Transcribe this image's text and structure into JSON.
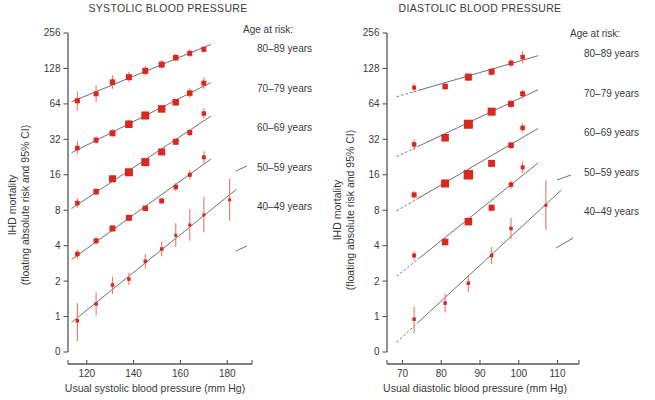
{
  "figure": {
    "accent_color": "#d8281f",
    "ci_color": "#e8786a",
    "line_color": "#4a4a4a",
    "text_color": "#3a3a3a"
  },
  "legend": {
    "heading": "Age at risk:",
    "items": [
      {
        "label": "80–89 years"
      },
      {
        "label": "70–79 years"
      },
      {
        "label": "60–69 years"
      },
      {
        "label": "50–59 years"
      },
      {
        "label": "40–49 years"
      }
    ]
  },
  "chart_data": [
    {
      "id": "systolic",
      "type": "scatter",
      "title": "SYSTOLIC BLOOD PRESSURE",
      "xlabel": "Usual systolic blood pressure (mm Hg)",
      "ylabel": "IHD mortality\n(floating absolute risk and 95% CI)",
      "ylabel_line1": "IHD mortality",
      "ylabel_line2": "(floating absolute risk and 95% CI)",
      "yscale": "log2",
      "yticks": [
        0,
        1,
        2,
        4,
        8,
        16,
        32,
        64,
        128,
        256
      ],
      "yticklabels": [
        "0",
        "1",
        "2",
        "4",
        "8",
        "16",
        "32",
        "64",
        "128",
        "256"
      ],
      "xticks": [
        120,
        140,
        160,
        180
      ],
      "xticklabels": [
        "120",
        "140",
        "160",
        "180"
      ],
      "xlim": [
        112,
        188
      ],
      "grid": false,
      "legend_position": "right",
      "series": [
        {
          "name": "80–89 years",
          "x": [
            116,
            124,
            131,
            138,
            145,
            152,
            158,
            164,
            170
          ],
          "values": [
            68,
            78,
            98,
            108,
            122,
            138,
            158,
            172,
            186
          ],
          "ci_low": [
            56,
            66,
            86,
            98,
            112,
            128,
            148,
            160,
            176
          ],
          "ci_high": [
            82,
            92,
            112,
            120,
            134,
            150,
            170,
            186,
            198
          ],
          "sizes": [
            5,
            5,
            5.5,
            6,
            6,
            6,
            5.5,
            5,
            5
          ]
        },
        {
          "name": "70–79 years",
          "x": [
            116,
            124,
            131,
            138,
            145,
            152,
            158,
            164,
            170
          ],
          "values": [
            27,
            31.5,
            36,
            43,
            51,
            58,
            66,
            79,
            96
          ],
          "ci_low": [
            24,
            29,
            34,
            40,
            48,
            55,
            62,
            72,
            86
          ],
          "ci_high": [
            31,
            34,
            39,
            47,
            55,
            62,
            71,
            87,
            108
          ],
          "sizes": [
            4.5,
            5,
            6,
            7.5,
            8,
            7.5,
            6.5,
            5.5,
            5
          ]
        },
        {
          "name": "60–69 years",
          "x": [
            116,
            124,
            131,
            138,
            145,
            152,
            158,
            164,
            170
          ],
          "values": [
            9.2,
            11.5,
            14.8,
            16.8,
            20.5,
            25,
            30.5,
            36.5,
            53
          ],
          "ci_low": [
            8.4,
            10.8,
            14.0,
            15.8,
            19.4,
            23.6,
            28.8,
            34.0,
            48
          ],
          "ci_high": [
            10.1,
            12.3,
            15.7,
            17.9,
            21.7,
            26.5,
            32.3,
            39.2,
            59
          ],
          "sizes": [
            4.5,
            5.5,
            7,
            8,
            8,
            7,
            6,
            5,
            4.5
          ]
        },
        {
          "name": "50–59 years",
          "x": [
            116,
            124,
            131,
            138,
            145,
            152,
            158,
            164,
            170
          ],
          "values": [
            3.4,
            4.4,
            5.6,
            6.9,
            8.3,
            9.6,
            12.6,
            16.0,
            22.5
          ],
          "ci_low": [
            3.1,
            4.1,
            5.3,
            6.5,
            7.9,
            9.1,
            11.6,
            14.6,
            20.0
          ],
          "ci_high": [
            3.7,
            4.7,
            5.9,
            7.3,
            8.7,
            10.1,
            13.7,
            17.5,
            25.3
          ],
          "sizes": [
            4.5,
            5,
            6,
            6,
            5.5,
            5,
            4.5,
            4,
            4
          ]
        },
        {
          "name": "40–49 years",
          "x": [
            116,
            124,
            131,
            138,
            145,
            152,
            158,
            164,
            170,
            181
          ],
          "values": [
            0.92,
            1.28,
            1.85,
            2.08,
            2.95,
            3.75,
            4.9,
            6.0,
            7.3,
            9.8
          ],
          "ci_low": [
            0.62,
            1.02,
            1.55,
            1.85,
            2.55,
            3.25,
            3.9,
            4.4,
            5.2,
            6.5
          ],
          "ci_high": [
            1.3,
            1.6,
            2.18,
            2.35,
            3.4,
            4.35,
            6.2,
            8.2,
            10.4,
            14.8
          ],
          "sizes": [
            3.5,
            3.5,
            3.5,
            3.5,
            3.5,
            3.5,
            3,
            3,
            3,
            3
          ]
        }
      ]
    },
    {
      "id": "diastolic",
      "type": "scatter",
      "title": "DIASTOLIC BLOOD PRESSURE",
      "xlabel": "Usual diastolic blood pressure (mm Hg)",
      "ylabel_line1": "IHD mortality",
      "ylabel_line2": "(floating absolute risk and 95% CI)",
      "yscale": "log2",
      "yticks": [
        0,
        1,
        2,
        4,
        8,
        16,
        32,
        64,
        128,
        256
      ],
      "yticklabels": [
        "0",
        "1",
        "2",
        "4",
        "8",
        "16",
        "32",
        "64",
        "128",
        "256"
      ],
      "xticks": [
        70,
        80,
        90,
        100,
        110
      ],
      "xticklabels": [
        "70",
        "80",
        "90",
        "100",
        "110"
      ],
      "xlim": [
        66,
        114
      ],
      "grid": false,
      "legend_position": "right",
      "series": [
        {
          "name": "80–89 years",
          "x": [
            73,
            81,
            87,
            93,
            98,
            101
          ],
          "values": [
            88,
            90,
            108,
            120,
            142,
            160
          ],
          "ci_low": [
            80,
            84,
            100,
            112,
            132,
            142
          ],
          "ci_high": [
            96,
            97,
            117,
            129,
            153,
            180
          ],
          "sizes": [
            4,
            5.5,
            7,
            6,
            5,
            4.5
          ]
        },
        {
          "name": "70–79 years",
          "x": [
            73,
            81,
            87,
            93,
            98,
            101
          ],
          "values": [
            29,
            33,
            43,
            55,
            64,
            78
          ],
          "ci_low": [
            26,
            30.5,
            40,
            51,
            59,
            71
          ],
          "ci_high": [
            32,
            35.6,
            46.3,
            59,
            69,
            85
          ],
          "sizes": [
            4.5,
            7.5,
            9,
            8,
            6,
            5
          ]
        },
        {
          "name": "60–69 years",
          "x": [
            73,
            81,
            87,
            93,
            98,
            101
          ],
          "values": [
            10.8,
            13.5,
            16.0,
            20.0,
            28.5,
            40
          ],
          "ci_low": [
            10.0,
            12.6,
            15.1,
            18.8,
            26.6,
            36.5
          ],
          "ci_high": [
            11.7,
            14.5,
            17.0,
            21.3,
            30.5,
            43.8
          ],
          "sizes": [
            5,
            8,
            9.5,
            7,
            5.5,
            4.5
          ]
        },
        {
          "name": "50–59 years",
          "x": [
            73,
            81,
            87,
            93,
            98,
            101
          ],
          "values": [
            3.3,
            4.3,
            6.4,
            8.4,
            13.2,
            18.5
          ],
          "ci_low": [
            3.0,
            4.0,
            6.0,
            7.9,
            12.2,
            16.5
          ],
          "ci_high": [
            3.6,
            4.7,
            6.9,
            9.0,
            14.3,
            20.8
          ],
          "sizes": [
            4,
            6.5,
            7.5,
            6,
            4.5,
            4
          ]
        },
        {
          "name": "40–49 years",
          "x": [
            73,
            81,
            87,
            93,
            98,
            107
          ],
          "values": [
            0.95,
            1.3,
            1.92,
            3.3,
            5.6,
            8.8
          ],
          "ci_low": [
            0.72,
            1.08,
            1.62,
            2.8,
            4.55,
            5.4
          ],
          "ci_high": [
            1.22,
            1.56,
            2.25,
            3.9,
            6.9,
            14.5
          ],
          "sizes": [
            3.5,
            3.5,
            3.5,
            3.5,
            3.5,
            3
          ]
        }
      ]
    }
  ]
}
